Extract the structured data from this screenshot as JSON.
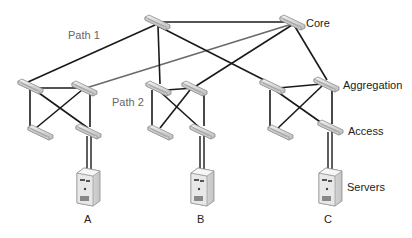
{
  "diagram": {
    "type": "network-topology",
    "layers": {
      "core": "Core",
      "aggregation": "Aggregation",
      "access": "Access",
      "servers": "Servers"
    },
    "paths": {
      "path1": "Path 1",
      "path2": "Path 2"
    },
    "server_labels": {
      "a": "A",
      "b": "B",
      "c": "C"
    },
    "colors": {
      "link_dark": "#1a1a1a",
      "link_gray": "#6a6a6a",
      "switch_fill": "#d8d8d8",
      "switch_edge": "#8a8a8a",
      "server_fill": "#e2e2e2"
    }
  }
}
